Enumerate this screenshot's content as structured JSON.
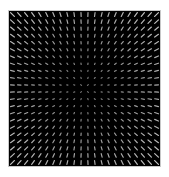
{
  "chart_data": {
    "type": "quiver",
    "title": "",
    "xlabel": "",
    "ylabel": "",
    "grid": {
      "cols": 22,
      "rows": 22
    },
    "field": "radial",
    "center": [
      0.5,
      0.5
    ],
    "max_segment_length_px": 5,
    "colors": {
      "background": "#000000",
      "segment": "#c8c8c8",
      "border": "#c8c8c8"
    }
  }
}
